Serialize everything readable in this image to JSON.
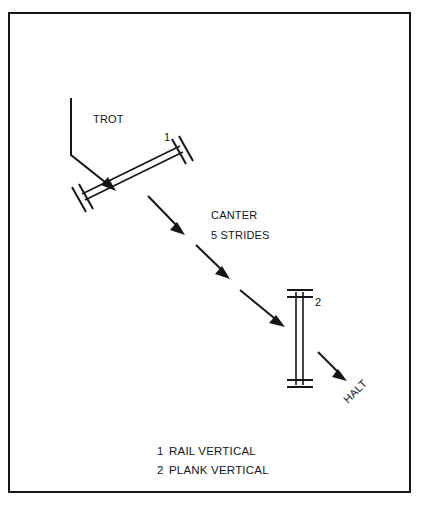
{
  "diagram": {
    "title_visible": false,
    "border": {
      "color": "#161616",
      "width": 2,
      "x": 9,
      "y": 13,
      "w": 401,
      "h": 479
    },
    "ink_color": "#161616",
    "background_color": "#ffffff",
    "labels": {
      "trot": "TROT",
      "canter": "CANTER",
      "strides": "5 STRIDES",
      "halt": "HALT",
      "jump_one_number": "1",
      "jump_two_number": "2"
    },
    "legend": {
      "items": [
        {
          "number": "1",
          "name": "RAIL VERTICAL"
        },
        {
          "number": "2",
          "name": "PLANK VERTICAL"
        }
      ]
    },
    "obstacles": [
      {
        "id": "jump-1",
        "number": "1",
        "type": "RAIL VERTICAL",
        "orientation": "diagonal",
        "angle_deg": -26,
        "x1": 82,
        "y1": 197,
        "x2": 182,
        "y2": 148
      },
      {
        "id": "jump-2",
        "number": "2",
        "type": "PLANK VERTICAL",
        "orientation": "vertical",
        "angle_deg": 90,
        "x1": 299,
        "y1": 292,
        "x2": 299,
        "y2": 385
      }
    ],
    "path_arrows": [
      {
        "id": "approach-trot",
        "label": "TROT",
        "kind": "bent",
        "points": "71,98 71,155 111,162"
      },
      {
        "id": "canter-1",
        "label": "",
        "kind": "straight",
        "points": "148,196 183,232"
      },
      {
        "id": "canter-2",
        "label": "",
        "kind": "straight",
        "points": "196,245 228,276"
      },
      {
        "id": "canter-3",
        "label": "",
        "kind": "straight",
        "points": "240,290 282,325"
      },
      {
        "id": "exit-halt",
        "label": "HALT",
        "kind": "straight",
        "points": "318,352 345,380"
      }
    ]
  }
}
